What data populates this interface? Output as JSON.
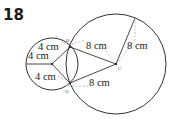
{
  "problem_number": "18",
  "labels": {
    "small_r1": "4 cm",
    "small_r2": "4 cm",
    "small_r3": "4 cm",
    "large_r1": "8 cm",
    "large_r2": "8 cm",
    "large_r3": "8 cm"
  },
  "points": {
    "B": "B",
    "C": "C",
    "D": "D"
  },
  "colors": {
    "line": "#333333",
    "dashed": "#999999"
  }
}
